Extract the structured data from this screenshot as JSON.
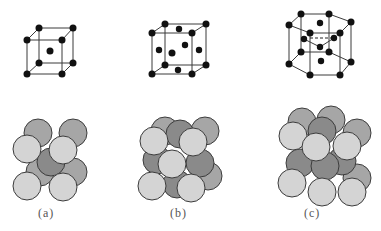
{
  "figure": {
    "panels": [
      {
        "id": "a",
        "label": "(a)",
        "structure": "body-centered cubic"
      },
      {
        "id": "b",
        "label": "(b)",
        "structure": "face-centered cubic"
      },
      {
        "id": "c",
        "label": "(c)",
        "structure": "hexagonal close-packed"
      }
    ],
    "colors": {
      "atom": "#111111",
      "sphere_light": "#d4d4d4",
      "sphere_medium": "#a6a6a6",
      "sphere_dark": "#8a8a8a",
      "edge": "#3a3a3a"
    }
  }
}
